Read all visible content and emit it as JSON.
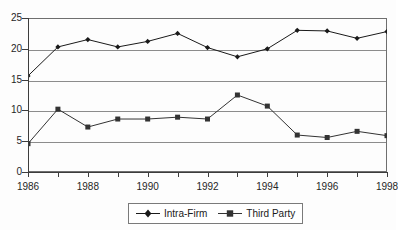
{
  "chart_data": {
    "type": "line",
    "title": "",
    "xlabel": "",
    "ylabel": "",
    "x": [
      1986,
      1987,
      1988,
      1989,
      1990,
      1991,
      1992,
      1993,
      1994,
      1995,
      1996,
      1997,
      1998
    ],
    "xtick_labels": [
      "1986",
      "1988",
      "1990",
      "1992",
      "1994",
      "1996",
      "1998"
    ],
    "xtick_values": [
      1986,
      1988,
      1990,
      1992,
      1994,
      1996,
      1998
    ],
    "ytick_labels": [
      "0",
      "5",
      "10",
      "15",
      "20",
      "25"
    ],
    "ytick_values": [
      0,
      5,
      10,
      15,
      20,
      25
    ],
    "xlim": [
      1986,
      1998
    ],
    "ylim": [
      0,
      25
    ],
    "grid": true,
    "grid_axis": "y",
    "legend_position": "bottom-center",
    "series": [
      {
        "name": "Intra-Firm",
        "marker": "diamond",
        "color": "#1a1a1a",
        "values": [
          15.6,
          20.3,
          21.5,
          20.3,
          21.2,
          22.5,
          20.2,
          18.7,
          20.0,
          23.0,
          22.9,
          21.7,
          22.8
        ]
      },
      {
        "name": "Third Party",
        "marker": "square",
        "color": "#333333",
        "values": [
          4.6,
          10.2,
          7.3,
          8.6,
          8.6,
          8.9,
          8.6,
          12.5,
          10.7,
          6.0,
          5.6,
          6.6,
          5.9
        ]
      }
    ]
  },
  "legend": {
    "entries": [
      {
        "label": "Intra-Firm",
        "marker": "diamond"
      },
      {
        "label": "Third Party",
        "marker": "square"
      }
    ]
  }
}
